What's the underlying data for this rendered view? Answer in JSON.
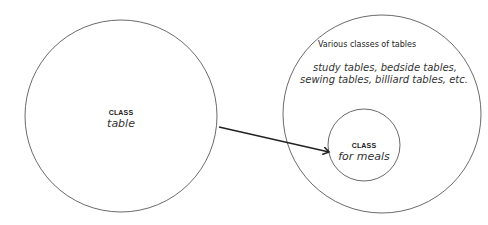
{
  "diagram": {
    "left_circle": {
      "heading": "CLASS",
      "name": "table"
    },
    "right_circle": {
      "title": "Various classes of tables",
      "examples_line1": "study tables, bedside tables,",
      "examples_line2": "sewing tables, billiard tables, etc.",
      "inner_circle": {
        "heading": "CLASS",
        "name": "for meals"
      }
    },
    "arrow": {
      "from": "left_circle",
      "to": "inner_circle"
    },
    "stroke_color": "#333333"
  }
}
